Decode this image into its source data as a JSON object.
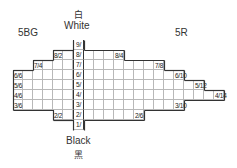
{
  "labels": {
    "white_cjk": "白",
    "white": "White",
    "black": "Black",
    "black_cjk": "黑",
    "left_hue": "5BG",
    "right_hue": "5R"
  },
  "value_column": [
    "9/",
    "8/",
    "7/",
    "6/",
    "5/",
    "4/",
    "3/",
    "2/",
    "1/"
  ],
  "left_extent": {
    "9": 0,
    "8": 2,
    "7": 4,
    "6": 6,
    "5": 6,
    "4": 6,
    "3": 6,
    "2": 2,
    "1": 0
  },
  "right_extent": {
    "9": 0,
    "8": 4,
    "7": 8,
    "6": 10,
    "5": 12,
    "4": 14,
    "3": 10,
    "2": 6,
    "1": 0
  },
  "left_tags": [
    {
      "value": 8,
      "chroma": 2,
      "text": "8/2"
    },
    {
      "value": 7,
      "chroma": 4,
      "text": "7/4"
    },
    {
      "value": 6,
      "chroma": 6,
      "text": "6/6"
    },
    {
      "value": 5,
      "chroma": 6,
      "text": "5/6"
    },
    {
      "value": 4,
      "chroma": 6,
      "text": "4/6"
    },
    {
      "value": 3,
      "chroma": 6,
      "text": "3/6"
    },
    {
      "value": 2,
      "chroma": 2,
      "text": "2/2"
    }
  ],
  "right_tags": [
    {
      "value": 8,
      "chroma": 4,
      "text": "8/4"
    },
    {
      "value": 7,
      "chroma": 8,
      "text": "7/8"
    },
    {
      "value": 6,
      "chroma": 10,
      "text": "6/10"
    },
    {
      "value": 5,
      "chroma": 12,
      "text": "5/12"
    },
    {
      "value": 4,
      "chroma": 14,
      "text": "4/14"
    },
    {
      "value": 3,
      "chroma": 10,
      "text": "3/10"
    },
    {
      "value": 2,
      "chroma": 6,
      "text": "2/6"
    }
  ]
}
